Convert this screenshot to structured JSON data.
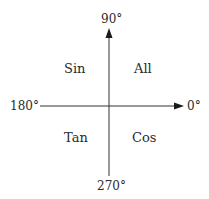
{
  "diagram": {
    "title": "",
    "axes": {
      "top": "90°",
      "left": "180°",
      "right": "0°",
      "bottom": "270°"
    },
    "quadrants": {
      "top_left": "Sin",
      "top_right": "All",
      "bottom_left": "Tan",
      "bottom_right": "Cos"
    },
    "colors": {
      "line": "#333333",
      "text": "#2a2a2a",
      "background": "#ffffff"
    }
  }
}
